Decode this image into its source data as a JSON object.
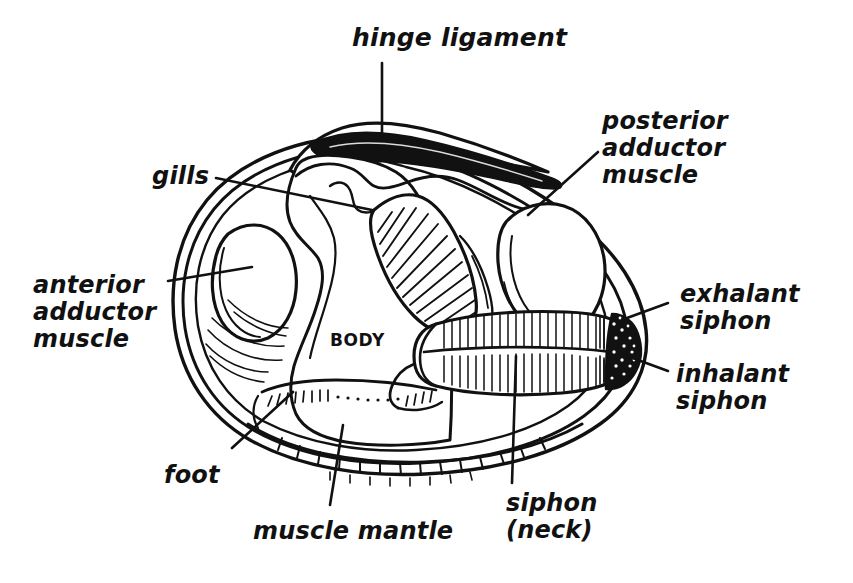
{
  "figure": {
    "background_color": "#ffffff",
    "ink_color": "#111111",
    "body_label": "BODY"
  },
  "labels": [
    {
      "id": "hinge-ligament",
      "text": "hinge ligament",
      "align": "center",
      "x": 352,
      "y": 24,
      "size": "lbl-xl"
    },
    {
      "id": "posterior-adductor-muscle",
      "text": "posterior\nadductor\nmuscle",
      "align": "left",
      "x": 602,
      "y": 108,
      "size": "lbl-lg"
    },
    {
      "id": "gills",
      "text": "gills",
      "align": "left",
      "x": 152,
      "y": 163,
      "size": "lbl-lg"
    },
    {
      "id": "anterior-adductor-muscle",
      "text": "anterior\nadductor\nmuscle",
      "align": "left",
      "x": 33,
      "y": 272,
      "size": "lbl-lg"
    },
    {
      "id": "exhalant-siphon",
      "text": "exhalant\nsiphon",
      "align": "left",
      "x": 680,
      "y": 281,
      "size": "lbl-lg"
    },
    {
      "id": "inhalant-siphon",
      "text": "inhalant\nsiphon",
      "align": "left",
      "x": 676,
      "y": 361,
      "size": "lbl-lg"
    },
    {
      "id": "foot",
      "text": "foot",
      "align": "left",
      "x": 164,
      "y": 462,
      "size": "lbl-lg"
    },
    {
      "id": "muscle-mantle",
      "text": "muscle mantle",
      "align": "left",
      "x": 253,
      "y": 518,
      "size": "lbl-lg"
    },
    {
      "id": "siphon-neck",
      "text": "siphon\n(neck)",
      "align": "left",
      "x": 506,
      "y": 490,
      "size": "lbl-lg"
    }
  ],
  "leader_lines": [
    {
      "id": "hinge-ligament-leader",
      "points": "382,63 382,136"
    },
    {
      "id": "posterior-adductor-muscle-leader",
      "points": "598,152 528,215"
    },
    {
      "id": "gills-leader",
      "points": "216,178 372,210"
    },
    {
      "id": "anterior-adductor-muscle-leader",
      "points": "168,281 252,267"
    },
    {
      "id": "exhalant-siphon-leader",
      "points": "668,303 627,318"
    },
    {
      "id": "inhalant-siphon-leader",
      "points": "668,371 627,356"
    },
    {
      "id": "foot-leader",
      "points": "232,448 293,392"
    },
    {
      "id": "muscle-mantle-leader",
      "points": "330,505 343,425"
    },
    {
      "id": "siphon-neck-leader",
      "points": "512,483 516,356"
    }
  ],
  "anatomy_parts": [
    {
      "id": "shell-outline",
      "label": "shell outline"
    },
    {
      "id": "hinge-ligament-shape",
      "label": "hinge ligament"
    },
    {
      "id": "gills-shape",
      "label": "gills"
    },
    {
      "id": "anterior-adductor-shape",
      "label": "anterior adductor muscle"
    },
    {
      "id": "posterior-adductor-shape",
      "label": "posterior adductor muscle"
    },
    {
      "id": "siphon-shape",
      "label": "siphon (neck)"
    },
    {
      "id": "siphon-tip-shape",
      "label": "siphon tip"
    },
    {
      "id": "foot-shape",
      "label": "foot"
    },
    {
      "id": "mantle-shape",
      "label": "muscle mantle"
    },
    {
      "id": "body-shape",
      "label": "body mass"
    }
  ]
}
